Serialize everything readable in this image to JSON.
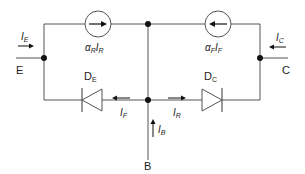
{
  "diagram": {
    "terminals": {
      "emitter": "E",
      "collector": "C",
      "base": "B"
    },
    "currents": {
      "emitter": {
        "sym": "I",
        "sub": "E"
      },
      "collector": {
        "sym": "I",
        "sub": "C"
      },
      "base": {
        "sym": "I",
        "sub": "B"
      },
      "forward": {
        "sym": "I",
        "sub": "F"
      },
      "reverse": {
        "sym": "I",
        "sub": "R"
      }
    },
    "sources": [
      {
        "id": "source-reverse",
        "alpha": "α",
        "alpha_sub": "R",
        "sym": "I",
        "sub": "R",
        "direction": "right"
      },
      {
        "id": "source-forward",
        "alpha": "α",
        "alpha_sub": "F",
        "sym": "I",
        "sub": "F",
        "direction": "left"
      }
    ],
    "diodes": [
      {
        "id": "diode-emitter",
        "label": "D",
        "sub": "E",
        "direction": "left"
      },
      {
        "id": "diode-collector",
        "label": "D",
        "sub": "C",
        "direction": "right"
      }
    ],
    "colors": {
      "wire": "#555555",
      "node": "#111111",
      "text": "#222222"
    }
  }
}
